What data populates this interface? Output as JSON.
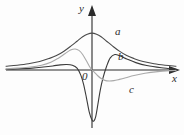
{
  "figure": {
    "background_color": "#fdfdfd",
    "width": 184,
    "height": 135
  },
  "axes": {
    "x_label": "x",
    "y_label": "y",
    "origin_label": "0",
    "axis_color": "#2b2b2b",
    "x_axis_y_px": 70,
    "y_axis_x_px": 92
  },
  "curve_labels": {
    "a": "a",
    "b": "b",
    "c": "c"
  },
  "chart_data": {
    "type": "line",
    "title": "",
    "xlabel": "x",
    "ylabel": "y",
    "grid": false,
    "legend": "inline-curve-labels",
    "xlim": [
      -4.6,
      4.6
    ],
    "ylim": [
      -2.6,
      1.3
    ],
    "annotations": [
      {
        "text": "a",
        "x": 1.15,
        "y": 0.78
      },
      {
        "text": "b",
        "x": 1.25,
        "y": 0.33
      },
      {
        "text": "c",
        "x": 1.75,
        "y": -0.33
      },
      {
        "text": "0",
        "x": -0.22,
        "y": -0.17
      }
    ],
    "series": [
      {
        "name": "a",
        "color": "#4a4a4a",
        "width": 1.1,
        "description": "Bell-shaped Lorentzian absorption curve, peak centred on the y-axis",
        "x": [
          -4.6,
          -4.0,
          -3.4,
          -2.8,
          -2.3,
          -1.9,
          -1.5,
          -1.1,
          -0.8,
          -0.5,
          -0.25,
          0.0,
          0.25,
          0.5,
          0.8,
          1.1,
          1.5,
          1.9,
          2.3,
          2.8,
          3.4,
          4.0,
          4.6
        ],
        "y": [
          0.1,
          0.13,
          0.17,
          0.23,
          0.31,
          0.39,
          0.51,
          0.66,
          0.78,
          0.9,
          0.97,
          1.0,
          0.97,
          0.9,
          0.78,
          0.66,
          0.51,
          0.39,
          0.31,
          0.23,
          0.17,
          0.13,
          0.1
        ]
      },
      {
        "name": "b",
        "color": "#3a3a3a",
        "width": 1.1,
        "description": "Dispersion-like curve with a deep negative minimum just left of the origin and a smaller positive maximum to the right",
        "x": [
          -4.6,
          -4.0,
          -3.2,
          -2.6,
          -2.1,
          -1.7,
          -1.35,
          -1.05,
          -0.8,
          -0.6,
          -0.45,
          -0.3,
          -0.15,
          0.0,
          0.1,
          0.2,
          0.32,
          0.45,
          0.6,
          0.8,
          1.0,
          1.25,
          1.55,
          1.9,
          2.4,
          3.0,
          3.8,
          4.6
        ],
        "y": [
          0.02,
          0.03,
          0.05,
          0.08,
          0.11,
          0.14,
          0.15,
          0.13,
          0.05,
          -0.25,
          -0.7,
          -1.35,
          -2.05,
          -2.45,
          -2.5,
          -2.3,
          -1.7,
          -1.0,
          -0.4,
          0.1,
          0.33,
          0.42,
          0.38,
          0.3,
          0.2,
          0.12,
          0.06,
          0.02
        ]
      },
      {
        "name": "c",
        "color": "#a9a9a9",
        "width": 1.1,
        "description": "Light-grey dispersion curve, broad positive maximum left of the y-axis and a broad negative minimum to the right",
        "x": [
          -4.6,
          -4.0,
          -3.3,
          -2.7,
          -2.2,
          -1.8,
          -1.45,
          -1.15,
          -0.9,
          -0.7,
          -0.5,
          -0.3,
          -0.15,
          0.0,
          0.15,
          0.3,
          0.5,
          0.7,
          0.95,
          1.2,
          1.5,
          1.85,
          2.3,
          2.9,
          3.6,
          4.3,
          4.6
        ],
        "y": [
          0.03,
          0.05,
          0.08,
          0.13,
          0.21,
          0.32,
          0.44,
          0.54,
          0.57,
          0.53,
          0.42,
          0.25,
          0.11,
          0.0,
          -0.13,
          -0.27,
          -0.42,
          -0.51,
          -0.54,
          -0.52,
          -0.46,
          -0.38,
          -0.27,
          -0.16,
          -0.08,
          -0.03,
          -0.02
        ]
      }
    ]
  }
}
